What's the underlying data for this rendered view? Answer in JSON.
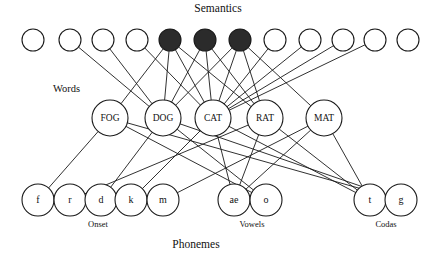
{
  "figure": {
    "title_top": "Semantics",
    "title_bottom": "Phonemes",
    "label_words": "Words",
    "label_onset": "Onset",
    "label_vowels": "Vowels",
    "label_codas": "Codas",
    "colors": {
      "node_fill_open": "#ffffff",
      "node_fill_active": "#2b2b2b",
      "stroke": "#1a1a1a",
      "background": "#ffffff",
      "text": "#111111"
    }
  },
  "chart_data": {
    "type": "diagram",
    "title": "Semantics",
    "layers": [
      {
        "name": "semantics",
        "label": "Semantics",
        "y": 40,
        "radius": 11,
        "node_count": 11,
        "nodes": [
          {
            "id": "s1",
            "label": "",
            "x": 33,
            "active": false
          },
          {
            "id": "s2",
            "label": "",
            "x": 70,
            "active": false
          },
          {
            "id": "s3",
            "label": "",
            "x": 103,
            "active": false
          },
          {
            "id": "s4",
            "label": "",
            "x": 137,
            "active": false
          },
          {
            "id": "s5",
            "label": "",
            "x": 170,
            "active": true
          },
          {
            "id": "s6",
            "label": "",
            "x": 205,
            "active": true
          },
          {
            "id": "s7",
            "label": "",
            "x": 240,
            "active": true
          },
          {
            "id": "s8",
            "label": "",
            "x": 275,
            "active": false
          },
          {
            "id": "s9",
            "label": "",
            "x": 310,
            "active": false
          },
          {
            "id": "s10",
            "label": "",
            "x": 343,
            "active": false
          },
          {
            "id": "s11",
            "label": "",
            "x": 375,
            "active": false
          },
          {
            "id": "s12",
            "label": "",
            "x": 408,
            "active": false
          }
        ]
      },
      {
        "name": "words",
        "label": "Words",
        "y": 118,
        "radius": 18,
        "node_count": 5,
        "nodes": [
          {
            "id": "FOG",
            "label": "FOG",
            "x": 110,
            "active": false
          },
          {
            "id": "DOG",
            "label": "DOG",
            "x": 163,
            "active": false
          },
          {
            "id": "CAT",
            "label": "CAT",
            "x": 213,
            "active": false
          },
          {
            "id": "RAT",
            "label": "RAT",
            "x": 265,
            "active": false
          },
          {
            "id": "MAT",
            "label": "MAT",
            "x": 324,
            "active": false
          }
        ]
      },
      {
        "name": "phonemes",
        "label": "Phonemes",
        "y": 200,
        "radius": 16,
        "groups": [
          {
            "name": "onset",
            "label": "Onset",
            "label_x": 98,
            "label_y": 227,
            "nodes": [
              {
                "id": "f",
                "label": "f",
                "x": 38,
                "active": false
              },
              {
                "id": "r",
                "label": "r",
                "x": 70,
                "active": false
              },
              {
                "id": "d",
                "label": "d",
                "x": 101,
                "active": false
              },
              {
                "id": "k",
                "label": "k",
                "x": 131,
                "active": false
              },
              {
                "id": "m",
                "label": "m",
                "x": 163,
                "active": false
              }
            ]
          },
          {
            "name": "vowels",
            "label": "Vowels",
            "label_x": 252,
            "label_y": 227,
            "nodes": [
              {
                "id": "ae",
                "label": "ae",
                "x": 234,
                "active": false
              },
              {
                "id": "o",
                "label": "o",
                "x": 266,
                "active": false
              }
            ]
          },
          {
            "name": "codas",
            "label": "Codas",
            "label_x": 386,
            "label_y": 227,
            "nodes": [
              {
                "id": "t",
                "label": "t",
                "x": 370,
                "active": false
              },
              {
                "id": "g",
                "label": "g",
                "x": 401,
                "active": false
              }
            ]
          }
        ]
      }
    ],
    "edges_semantics_words": [
      [
        "s2",
        "DOG"
      ],
      [
        "s3",
        "DOG"
      ],
      [
        "s4",
        "CAT"
      ],
      [
        "s5",
        "DOG"
      ],
      [
        "s5",
        "CAT"
      ],
      [
        "s5",
        "RAT"
      ],
      [
        "s6",
        "DOG"
      ],
      [
        "s6",
        "CAT"
      ],
      [
        "s6",
        "RAT"
      ],
      [
        "s7",
        "DOG"
      ],
      [
        "s7",
        "CAT"
      ],
      [
        "s7",
        "RAT"
      ],
      [
        "s8",
        "CAT"
      ],
      [
        "s9",
        "CAT"
      ],
      [
        "s10",
        "CAT"
      ],
      [
        "s11",
        "CAT"
      ],
      [
        "s5",
        "FOG"
      ],
      [
        "s7",
        "MAT"
      ]
    ],
    "edges_words_phonemes": [
      [
        "FOG",
        "f"
      ],
      [
        "FOG",
        "o"
      ],
      [
        "FOG",
        "g"
      ],
      [
        "DOG",
        "d"
      ],
      [
        "DOG",
        "o"
      ],
      [
        "DOG",
        "g"
      ],
      [
        "CAT",
        "k"
      ],
      [
        "CAT",
        "ae"
      ],
      [
        "CAT",
        "t"
      ],
      [
        "RAT",
        "r"
      ],
      [
        "RAT",
        "ae"
      ],
      [
        "RAT",
        "t"
      ],
      [
        "MAT",
        "m"
      ],
      [
        "MAT",
        "ae"
      ],
      [
        "MAT",
        "t"
      ]
    ]
  }
}
